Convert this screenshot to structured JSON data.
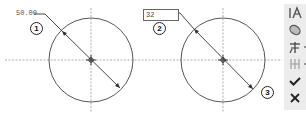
{
  "drawing": {
    "circles": [
      {
        "id": "circle-1",
        "cx": 91,
        "cy": 60,
        "r": 42
      },
      {
        "id": "circle-2",
        "cx": 223,
        "cy": 60,
        "r": 42
      }
    ],
    "dimension_1": {
      "value": "50.00",
      "style": "plain-text"
    },
    "dimension_2": {
      "value": "32",
      "style": "edit-box"
    }
  },
  "markers": [
    {
      "label": "1"
    },
    {
      "label": "2"
    },
    {
      "label": "3"
    }
  ],
  "toolbar": {
    "buttons": [
      {
        "name": "text-style-icon",
        "tooltip": ""
      },
      {
        "name": "fill-shape-icon",
        "tooltip": ""
      },
      {
        "name": "dimension-placement-icon",
        "tooltip": ""
      },
      {
        "name": "dimension-arrows-icon",
        "tooltip": ""
      },
      {
        "name": "confirm-checkmark-icon",
        "tooltip": ""
      },
      {
        "name": "cancel-x-icon",
        "tooltip": ""
      }
    ]
  },
  "colors": {
    "line": "#333333",
    "centerline": "#999999",
    "toolbar_bg": "#ececec"
  }
}
